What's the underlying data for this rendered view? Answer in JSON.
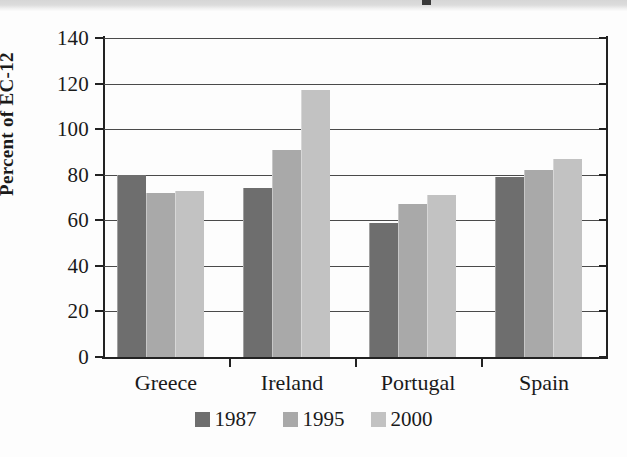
{
  "figure": {
    "background_color": "#fdfdfd",
    "top_band_color": "#d9d9d9"
  },
  "chart_data": {
    "type": "bar",
    "title": "",
    "subtitle": "",
    "xlabel": "",
    "ylabel": "Percent of EC-12",
    "categories": [
      "Greece",
      "Ireland",
      "Portugal",
      "Spain"
    ],
    "series": [
      {
        "name": "1987",
        "color": "#6e6e6e",
        "values": [
          80,
          74,
          59,
          79
        ]
      },
      {
        "name": "1995",
        "color": "#a9a9a9",
        "values": [
          72,
          91,
          67,
          82
        ]
      },
      {
        "name": "2000",
        "color": "#c2c2c2",
        "values": [
          73,
          117,
          71,
          87
        ]
      }
    ],
    "ylim": [
      0,
      140
    ],
    "ytick_values": [
      0,
      20,
      40,
      60,
      80,
      100,
      120,
      140
    ],
    "ytick_labels": [
      "0",
      "20",
      "40",
      "60",
      "80",
      "100",
      "120",
      "140"
    ],
    "grid": true,
    "grid_axis": "y",
    "legend_position": "bottom-center",
    "legend_entries": [
      "1987",
      "1995",
      "2000"
    ]
  }
}
